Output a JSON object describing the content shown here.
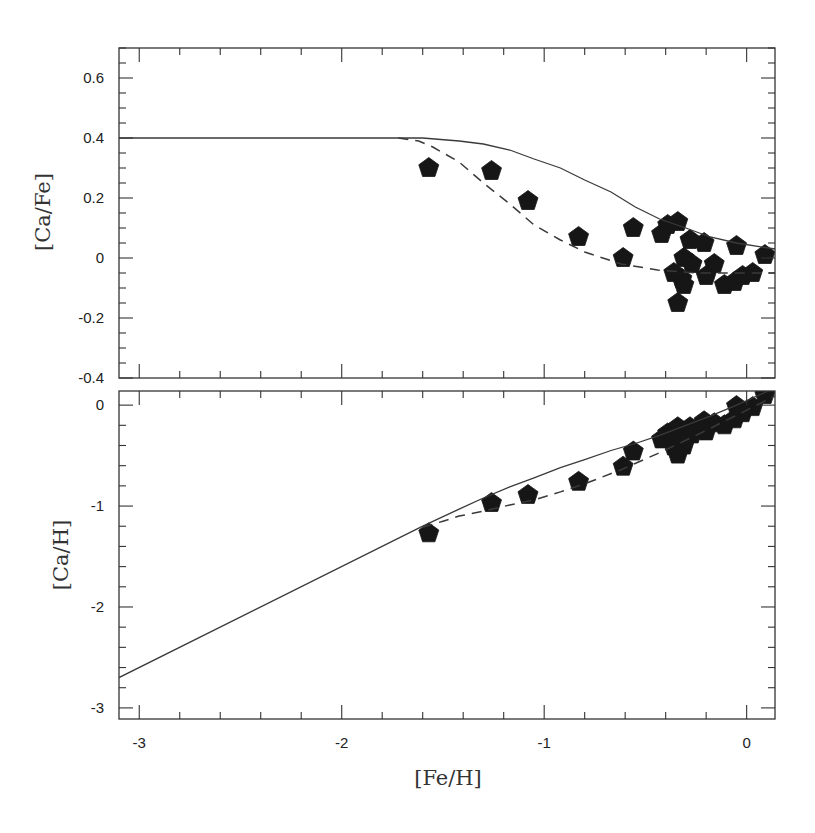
{
  "chart_data": [
    {
      "type": "scatter",
      "panel": "top",
      "title": "",
      "xlabel": "[Fe/H]",
      "ylabel": "[Ca/Fe]",
      "xlim": [
        -3.1,
        0.14
      ],
      "ylim": [
        -0.4,
        0.7
      ],
      "xticks": [
        -3,
        -2,
        -1,
        0
      ],
      "xtick_labels": [
        "-3",
        "-2",
        "-1",
        "0"
      ],
      "yticks": [
        0.6,
        0.4,
        0.2,
        0,
        -0.2,
        -0.4
      ],
      "ytick_labels": [
        "0.6",
        "0.4",
        "0.2",
        "0",
        "-0.2",
        "-0.4"
      ],
      "grid": false,
      "legend": null,
      "series": [
        {
          "name": "Observed stars",
          "style": "filled-pentagon",
          "points": [
            [
              -1.57,
              0.3
            ],
            [
              -1.26,
              0.29
            ],
            [
              -1.08,
              0.19
            ],
            [
              -0.83,
              0.07
            ],
            [
              -0.61,
              0.0
            ],
            [
              -0.56,
              0.1
            ],
            [
              -0.42,
              0.08
            ],
            [
              -0.39,
              0.11
            ],
            [
              -0.34,
              0.12
            ],
            [
              -0.28,
              0.06
            ],
            [
              -0.21,
              0.05
            ],
            [
              -0.05,
              0.04
            ],
            [
              0.09,
              0.01
            ],
            [
              -0.31,
              0.0
            ],
            [
              -0.27,
              -0.02
            ],
            [
              -0.16,
              -0.02
            ],
            [
              -0.36,
              -0.05
            ],
            [
              -0.32,
              -0.07
            ],
            [
              -0.31,
              -0.09
            ],
            [
              -0.2,
              -0.06
            ],
            [
              -0.11,
              -0.09
            ],
            [
              -0.06,
              -0.08
            ],
            [
              -0.02,
              -0.06
            ],
            [
              0.03,
              -0.05
            ],
            [
              -0.34,
              -0.15
            ]
          ]
        },
        {
          "name": "Model (solid)",
          "style": "solid-line",
          "points": [
            [
              -3.1,
              0.4
            ],
            [
              -1.6,
              0.4
            ],
            [
              -1.42,
              0.39
            ],
            [
              -1.3,
              0.38
            ],
            [
              -1.17,
              0.36
            ],
            [
              -1.05,
              0.33
            ],
            [
              -0.92,
              0.3
            ],
            [
              -0.8,
              0.26
            ],
            [
              -0.67,
              0.22
            ],
            [
              -0.55,
              0.17
            ],
            [
              -0.43,
              0.13
            ],
            [
              -0.3,
              0.1
            ],
            [
              -0.18,
              0.07
            ],
            [
              -0.05,
              0.05
            ],
            [
              0.14,
              0.03
            ]
          ]
        },
        {
          "name": "Model (dashed)",
          "style": "dashed-line",
          "points": [
            [
              -1.72,
              0.4
            ],
            [
              -1.62,
              0.39
            ],
            [
              -1.55,
              0.37
            ],
            [
              -1.42,
              0.32
            ],
            [
              -1.3,
              0.25
            ],
            [
              -1.17,
              0.18
            ],
            [
              -1.05,
              0.11
            ],
            [
              -0.92,
              0.06
            ],
            [
              -0.8,
              0.02
            ],
            [
              -0.62,
              -0.02
            ],
            [
              -0.44,
              -0.04
            ],
            [
              -0.25,
              -0.05
            ],
            [
              0.0,
              -0.05
            ],
            [
              0.14,
              -0.05
            ]
          ]
        }
      ]
    },
    {
      "type": "scatter",
      "panel": "bottom",
      "title": "",
      "xlabel": "[Fe/H]",
      "ylabel": "[Ca/H]",
      "xlim": [
        -3.1,
        0.14
      ],
      "ylim": [
        -3.11,
        0.14
      ],
      "xticks": [
        -3,
        -2,
        -1,
        0
      ],
      "xtick_labels": [
        "-3",
        "-2",
        "-1",
        "0"
      ],
      "yticks": [
        0,
        -1,
        -2,
        -3
      ],
      "ytick_labels": [
        "0",
        "-1",
        "-2",
        "-3"
      ],
      "grid": false,
      "legend": null,
      "series": [
        {
          "name": "Observed stars",
          "style": "filled-pentagon",
          "points": [
            [
              -1.57,
              -1.27
            ],
            [
              -1.26,
              -0.97
            ],
            [
              -1.08,
              -0.89
            ],
            [
              -0.83,
              -0.76
            ],
            [
              -0.61,
              -0.61
            ],
            [
              -0.56,
              -0.46
            ],
            [
              -0.42,
              -0.34
            ],
            [
              -0.39,
              -0.28
            ],
            [
              -0.34,
              -0.22
            ],
            [
              -0.28,
              -0.22
            ],
            [
              -0.21,
              -0.16
            ],
            [
              -0.05,
              -0.01
            ],
            [
              0.09,
              0.1
            ],
            [
              -0.31,
              -0.31
            ],
            [
              -0.27,
              -0.29
            ],
            [
              -0.16,
              -0.18
            ],
            [
              -0.36,
              -0.41
            ],
            [
              -0.32,
              -0.39
            ],
            [
              -0.31,
              -0.4
            ],
            [
              -0.2,
              -0.26
            ],
            [
              -0.11,
              -0.2
            ],
            [
              -0.06,
              -0.14
            ],
            [
              -0.02,
              -0.08
            ],
            [
              0.03,
              -0.02
            ],
            [
              -0.34,
              -0.49
            ]
          ]
        },
        {
          "name": "Model (solid)",
          "style": "solid-line",
          "points": [
            [
              -3.1,
              -2.7
            ],
            [
              -1.6,
              -1.2
            ],
            [
              -1.42,
              -1.03
            ],
            [
              -1.3,
              -0.92
            ],
            [
              -1.17,
              -0.81
            ],
            [
              -1.05,
              -0.72
            ],
            [
              -0.92,
              -0.62
            ],
            [
              -0.8,
              -0.54
            ],
            [
              -0.67,
              -0.45
            ],
            [
              -0.55,
              -0.38
            ],
            [
              -0.43,
              -0.3
            ],
            [
              -0.3,
              -0.2
            ],
            [
              -0.18,
              -0.11
            ],
            [
              -0.05,
              0.0
            ],
            [
              0.14,
              0.17
            ]
          ]
        },
        {
          "name": "Model (dashed)",
          "style": "dashed-line",
          "points": [
            [
              -1.6,
              -1.21
            ],
            [
              -1.5,
              -1.15
            ],
            [
              -1.42,
              -1.1
            ],
            [
              -1.3,
              -1.05
            ],
            [
              -1.17,
              -0.99
            ],
            [
              -1.05,
              -0.94
            ],
            [
              -0.92,
              -0.86
            ],
            [
              -0.8,
              -0.78
            ],
            [
              -0.62,
              -0.64
            ],
            [
              -0.44,
              -0.48
            ],
            [
              -0.25,
              -0.3
            ],
            [
              0.0,
              -0.05
            ],
            [
              0.14,
              0.09
            ]
          ]
        }
      ]
    }
  ],
  "labels": {
    "top_ylabel": "[Ca/Fe]",
    "bottom_ylabel": "[Ca/H]",
    "xlabel": "[Fe/H]"
  },
  "colors": {
    "axes": "#333333",
    "markers": "#161616",
    "lines": "#3a3a3a"
  }
}
